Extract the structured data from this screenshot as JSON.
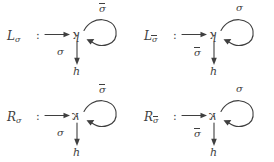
{
  "figure": {
    "kind": "commutative-diagrams",
    "columns": 2,
    "rows": 2,
    "stroke_color": "#3f3f3f",
    "background_color": "#ffffff",
    "sigma": "σ",
    "sigma_bar": "σ",
    "colon": ":",
    "target_node": "h"
  },
  "diagrams": [
    {
      "id": "L-sigma",
      "position": "top-left",
      "name_base": "L",
      "name_sub": "σ",
      "name_sub_overbar": false,
      "colon": ":",
      "node": "ʞ",
      "node_mirrored": false,
      "loop_label": "σ",
      "loop_label_overbar": true,
      "down_label": "σ",
      "down_label_overbar": false,
      "target": "h"
    },
    {
      "id": "L-sigma-bar",
      "position": "top-right",
      "name_base": "L",
      "name_sub": "σ",
      "name_sub_overbar": true,
      "colon": ":",
      "node": "ʞ",
      "node_mirrored": false,
      "loop_label": "σ",
      "loop_label_overbar": false,
      "down_label": "σ",
      "down_label_overbar": true,
      "target": "h"
    },
    {
      "id": "R-sigma",
      "position": "bottom-left",
      "name_base": "R",
      "name_sub": "σ",
      "name_sub_overbar": false,
      "colon": ":",
      "node": "к",
      "node_mirrored": true,
      "loop_label": "σ",
      "loop_label_overbar": true,
      "down_label": "σ",
      "down_label_overbar": false,
      "target": "h"
    },
    {
      "id": "R-sigma-bar",
      "position": "bottom-right",
      "name_base": "R",
      "name_sub": "σ",
      "name_sub_overbar": true,
      "colon": ":",
      "node": "к",
      "node_mirrored": true,
      "loop_label": "σ",
      "loop_label_overbar": false,
      "down_label": "σ",
      "down_label_overbar": true,
      "target": "h"
    }
  ]
}
